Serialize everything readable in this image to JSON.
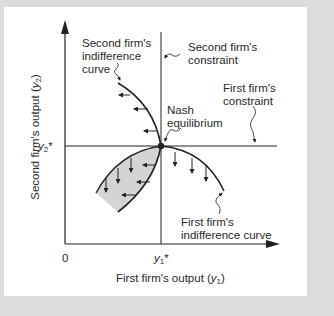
{
  "figure": {
    "x_axis_label": "First firm's output",
    "x_axis_symbol": "y",
    "x_axis_sub": "1",
    "y_axis_label": "Second firm's output",
    "y_axis_symbol": "y",
    "y_axis_sub": "2",
    "origin_label": "0",
    "x_star": {
      "symbol": "y",
      "sub": "1",
      "sup": "*"
    },
    "y_star": {
      "symbol": "y",
      "sub": "2",
      "sup": "*"
    },
    "annotations": {
      "second_indiff_line1": "Second firm's",
      "second_indiff_line2": "indifference",
      "second_indiff_line3": "curve",
      "second_constraint_line1": "Second firm's",
      "second_constraint_line2": "constraint",
      "first_constraint_line1": "First firm's",
      "first_constraint_line2": "constraint",
      "nash_line1": "Nash",
      "nash_line2": "equilibrium",
      "first_indiff_line1": "First firm's",
      "first_indiff_line2": "indifference curve"
    },
    "colors": {
      "shade": "#d4d4d4",
      "line": "#222222",
      "frame": "#dcdcdc"
    }
  }
}
